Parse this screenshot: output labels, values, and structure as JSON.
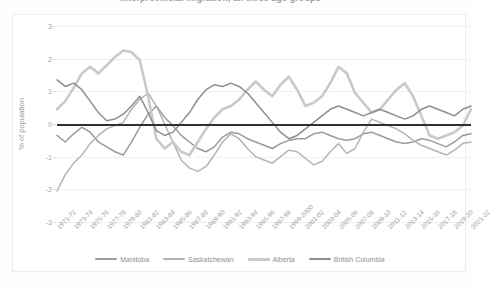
{
  "title": {
    "text": "interprovincial migration, all three age groups",
    "clipped": true
  },
  "axis": {
    "ylabel": "% of population",
    "yticks": [
      "3",
      "2",
      "1",
      "0",
      "-1",
      "-2",
      "-3"
    ],
    "ymin": -3,
    "ymax": 3,
    "xlabels": [
      "1971-72",
      "1973-74",
      "1975-76",
      "1977-78",
      "1979-80",
      "1981-82",
      "1983-84",
      "1985-86",
      "1987-88",
      "1989-90",
      "1991-92",
      "1993-94",
      "1995-96",
      "1997-98",
      "1999-2000",
      "2001-02",
      "2003-04",
      "2005-06",
      "2007-08",
      "2009-10",
      "2011-12",
      "2013-14",
      "2015-16",
      "2017-18",
      "2019-20",
      "2021-22"
    ]
  },
  "legend": [
    {
      "label": "Manitoba",
      "color": "#9b9b9b",
      "width": 2
    },
    {
      "label": "Saskatchewan",
      "color": "#b4b4b4",
      "width": 2
    },
    {
      "label": "Alberta",
      "color": "#c9c9c9",
      "width": 3
    },
    {
      "label": "British Columbia",
      "color": "#8e8e8e",
      "width": 2
    }
  ],
  "chart_data": {
    "type": "line",
    "title": "interprovincial migration, all three age groups",
    "xlabel": "",
    "ylabel": "% of population",
    "ylim": [
      -3,
      3
    ],
    "grid": true,
    "legend_position": "bottom",
    "x": [
      "1971-72",
      "1972-73",
      "1973-74",
      "1974-75",
      "1975-76",
      "1976-77",
      "1977-78",
      "1978-79",
      "1979-80",
      "1980-81",
      "1981-82",
      "1982-83",
      "1983-84",
      "1984-85",
      "1985-86",
      "1986-87",
      "1987-88",
      "1988-89",
      "1989-90",
      "1990-91",
      "1991-92",
      "1992-93",
      "1993-94",
      "1994-95",
      "1995-96",
      "1996-97",
      "1997-98",
      "1998-99",
      "1999-2000",
      "2000-01",
      "2001-02",
      "2002-03",
      "2003-04",
      "2004-05",
      "2005-06",
      "2006-07",
      "2007-08",
      "2008-09",
      "2009-10",
      "2010-11",
      "2011-12",
      "2012-13",
      "2013-14",
      "2014-15",
      "2015-16",
      "2016-17",
      "2017-18",
      "2018-19",
      "2019-20",
      "2020-21",
      "2021-22"
    ],
    "series": [
      {
        "name": "Manitoba",
        "color": "#9b9b9b",
        "values": [
          -0.35,
          -0.55,
          -0.3,
          -0.1,
          -0.25,
          -0.55,
          -0.7,
          -0.85,
          -0.95,
          -0.55,
          -0.1,
          0.3,
          0.55,
          0.2,
          -0.05,
          -0.35,
          -0.55,
          -0.75,
          -0.85,
          -0.7,
          -0.4,
          -0.25,
          -0.3,
          -0.45,
          -0.55,
          -0.65,
          -0.75,
          -0.6,
          -0.5,
          -0.45,
          -0.45,
          -0.3,
          -0.25,
          -0.35,
          -0.45,
          -0.5,
          -0.45,
          -0.3,
          -0.25,
          -0.35,
          -0.45,
          -0.55,
          -0.6,
          -0.55,
          -0.45,
          -0.5,
          -0.6,
          -0.7,
          -0.55,
          -0.35,
          -0.3
        ]
      },
      {
        "name": "Saskatchewan",
        "color": "#b4b4b4",
        "values": [
          -2.05,
          -1.55,
          -1.2,
          -0.95,
          -0.6,
          -0.35,
          -0.15,
          -0.05,
          0.05,
          0.45,
          0.75,
          0.95,
          0.55,
          0.0,
          -0.55,
          -1.1,
          -1.35,
          -1.45,
          -1.3,
          -0.95,
          -0.55,
          -0.3,
          -0.45,
          -0.75,
          -1.0,
          -1.1,
          -1.2,
          -1.0,
          -0.8,
          -0.85,
          -1.05,
          -1.25,
          -1.15,
          -0.85,
          -0.6,
          -0.9,
          -0.75,
          -0.25,
          0.15,
          0.05,
          -0.05,
          -0.15,
          -0.3,
          -0.5,
          -0.65,
          -0.75,
          -0.85,
          -0.95,
          -0.8,
          -0.6,
          -0.55
        ]
      },
      {
        "name": "Alberta",
        "color": "#c9c9c9",
        "values": [
          0.45,
          0.7,
          1.1,
          1.55,
          1.75,
          1.55,
          1.8,
          2.05,
          2.25,
          2.2,
          1.95,
          0.85,
          -0.45,
          -0.75,
          -0.55,
          -0.85,
          -0.95,
          -0.55,
          -0.15,
          0.2,
          0.45,
          0.55,
          0.75,
          1.05,
          1.3,
          1.05,
          0.85,
          1.2,
          1.45,
          1.05,
          0.55,
          0.65,
          0.85,
          1.25,
          1.75,
          1.55,
          0.95,
          0.65,
          0.35,
          0.45,
          0.75,
          1.05,
          1.25,
          0.85,
          0.25,
          -0.35,
          -0.45,
          -0.35,
          -0.25,
          -0.05,
          0.45
        ]
      },
      {
        "name": "British Columbia",
        "color": "#8e8e8e",
        "values": [
          1.35,
          1.15,
          1.25,
          1.05,
          0.7,
          0.35,
          0.1,
          0.15,
          0.3,
          0.55,
          0.85,
          0.35,
          -0.2,
          -0.35,
          -0.25,
          0.05,
          0.35,
          0.75,
          1.05,
          1.2,
          1.15,
          1.25,
          1.15,
          0.95,
          0.65,
          0.35,
          0.05,
          -0.25,
          -0.45,
          -0.35,
          -0.15,
          0.05,
          0.25,
          0.45,
          0.55,
          0.45,
          0.35,
          0.25,
          0.35,
          0.45,
          0.35,
          0.25,
          0.15,
          0.25,
          0.45,
          0.55,
          0.45,
          0.35,
          0.25,
          0.45,
          0.55
        ]
      }
    ]
  }
}
